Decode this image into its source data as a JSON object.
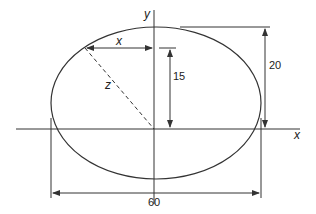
{
  "diagram": {
    "axes": {
      "x_label": "x",
      "y_label": "y"
    },
    "labels": {
      "horizontal_offset": "x",
      "diagonal": "z",
      "height_15": "15",
      "height_20": "20",
      "width_60": "60"
    },
    "dimensions": {
      "width": 60,
      "semi_height": 20,
      "point_height": 15
    },
    "colors": {
      "stroke": "#333333",
      "background": "#ffffff"
    }
  }
}
